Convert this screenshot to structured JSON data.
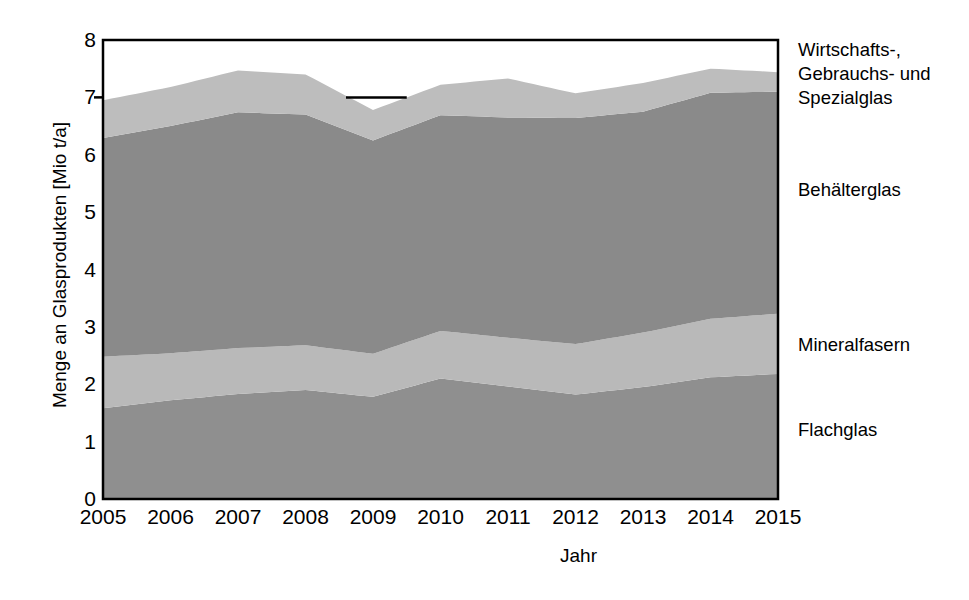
{
  "chart_data": {
    "type": "area",
    "stacked": true,
    "title": "",
    "xlabel": "Jahr",
    "ylabel": "Menge an Glasprodukten [Mio t/a]",
    "x": [
      2005,
      2006,
      2007,
      2008,
      2009,
      2010,
      2011,
      2012,
      2013,
      2014,
      2015
    ],
    "xtick_labels": [
      "2005",
      "2006",
      "2007",
      "2008",
      "2009",
      "2010",
      "2011",
      "2012",
      "2013",
      "2014",
      "2015"
    ],
    "ytick_labels": [
      "0",
      "1",
      "2",
      "3",
      "4",
      "5",
      "6",
      "7",
      "8"
    ],
    "xlim": [
      2005,
      2015
    ],
    "ylim": [
      0,
      8
    ],
    "grid": false,
    "legend_position": "right-inline",
    "series": [
      {
        "name": "Flachglas",
        "color": "#8f8f8f",
        "values": [
          1.58,
          1.72,
          1.83,
          1.9,
          1.78,
          2.1,
          1.96,
          1.82,
          1.95,
          2.12,
          2.18
        ]
      },
      {
        "name": "Mineralfasern",
        "color": "#b9b9b9",
        "values": [
          0.9,
          0.82,
          0.8,
          0.78,
          0.75,
          0.83,
          0.85,
          0.88,
          0.95,
          1.02,
          1.05
        ]
      },
      {
        "name": "Behälterglas",
        "color": "#8a8a8a",
        "values": [
          3.81,
          3.96,
          4.11,
          4.02,
          3.72,
          3.76,
          3.84,
          3.94,
          3.85,
          3.94,
          3.87
        ]
      },
      {
        "name": "Wirtschafts-, Gebrauchs- und Spezialglas",
        "color": "#bdbdbd",
        "values": [
          0.66,
          0.68,
          0.73,
          0.7,
          0.53,
          0.53,
          0.68,
          0.43,
          0.5,
          0.42,
          0.34
        ]
      }
    ],
    "totals": [
      6.95,
      7.18,
      7.47,
      7.4,
      6.78,
      7.22,
      7.33,
      7.07,
      7.25,
      7.5,
      7.44
    ],
    "annotations": [
      {
        "type": "reference-tick",
        "value": 7.0,
        "x_from": 2008.6,
        "x_to": 2009.5
      }
    ]
  },
  "legend": {
    "items": [
      {
        "label": "Wirtschafts-,\nGebrauchs- und\nSpezialglas",
        "top": 38
      },
      {
        "label": "Behälterglas",
        "top": 178
      },
      {
        "label": "Mineralfasern",
        "top": 333
      },
      {
        "label": "Flachglas",
        "top": 418
      }
    ]
  },
  "axes": {
    "y_title": "Menge an Glasprodukten [Mio t/a]",
    "x_title": "Jahr"
  }
}
